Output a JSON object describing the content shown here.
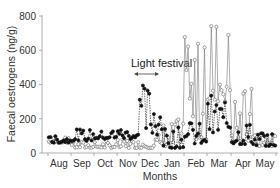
{
  "chart_data": {
    "type": "line",
    "title": "",
    "xlabel": "Months",
    "ylabel": "Faecal oestrogens (ng/g)",
    "ylim": [
      0,
      800
    ],
    "yticks": [
      0,
      200,
      400,
      600,
      800
    ],
    "categories": [
      "Aug",
      "Sep",
      "Oct",
      "Nov",
      "Dec",
      "Jan",
      "Feb",
      "Mar",
      "Apr",
      "May"
    ],
    "grid": false,
    "legend": null,
    "annotations": [
      {
        "text": "Light festival",
        "type": "double-arrow",
        "x_start": "late Nov",
        "x_end": "mid Dec",
        "y": 340
      }
    ],
    "series": [
      {
        "name": "Open circles (individual A)",
        "marker": "open-circle",
        "line": "solid",
        "monthly_approx": {
          "Aug": [
            60,
            90
          ],
          "Sep": [
            30,
            70
          ],
          "Oct": [
            30,
            70
          ],
          "Nov": [
            30,
            80
          ],
          "Dec": [
            30,
            120
          ],
          "Jan": [
            40,
            200
          ],
          "Feb": [
            80,
            690
          ],
          "Mar": [
            300,
            790
          ],
          "Apr": [
            60,
            400
          ],
          "May": [
            40,
            110
          ]
        },
        "peak": {
          "month": "Mar",
          "value": 790
        }
      },
      {
        "name": "Filled circles (individual B)",
        "marker": "filled-circle",
        "line": "dashed",
        "monthly_approx": {
          "Aug": [
            60,
            100
          ],
          "Sep": [
            70,
            140
          ],
          "Oct": [
            80,
            130
          ],
          "Nov": [
            80,
            150
          ],
          "Dec": [
            100,
            410
          ],
          "Jan": [
            30,
            150
          ],
          "Feb": [
            50,
            200
          ],
          "Mar": [
            100,
            350
          ],
          "Apr": [
            50,
            180
          ],
          "May": [
            40,
            120
          ]
        },
        "peak": {
          "month": "Dec",
          "value": 410
        }
      }
    ]
  },
  "labels": {
    "y_axis_title": "Faecal oestrogens (ng/g)",
    "x_axis_title": "Months",
    "annotation": "Light festival",
    "yticks": [
      "0",
      "200",
      "400",
      "600",
      "800"
    ],
    "months": [
      "Aug",
      "Sep",
      "Oct",
      "Nov",
      "Dec",
      "Jan",
      "Feb",
      "Mar",
      "Apr",
      "May"
    ]
  },
  "colors": {
    "axis": "#888888",
    "text": "#333333",
    "open_series": "#777777",
    "filled_series": "#111111"
  }
}
